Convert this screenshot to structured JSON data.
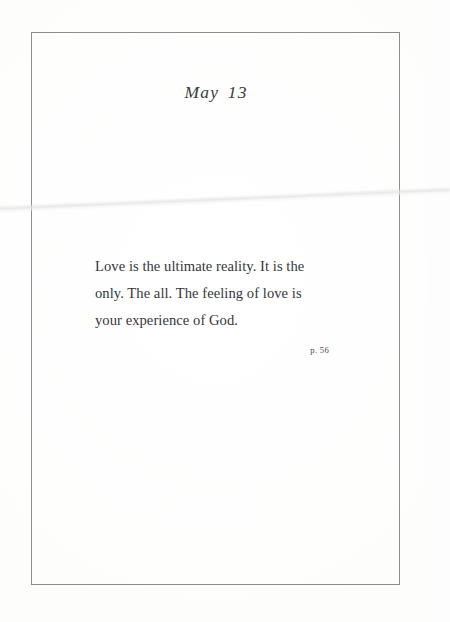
{
  "page": {
    "heading": "May 13",
    "quote_lines": [
      "Love is the ultimate reality. It is the",
      "only. The all. The feeling of love is",
      "your experience of God."
    ],
    "quote_full": "Love is the ultimate reality. It is the only. The all. The feeling of love is your experience of God.",
    "page_reference": "p. 56",
    "colors": {
      "paper": "#fcfcfc",
      "frame_rule": "#8a8a8a",
      "heading_text": "#3b3b3d",
      "body_text": "#36363a",
      "reference_text": "#4a4a50"
    }
  }
}
